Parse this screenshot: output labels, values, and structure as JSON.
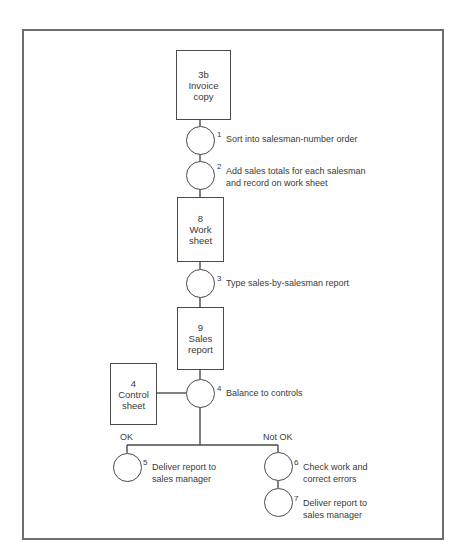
{
  "diagram": {
    "type": "flowchart",
    "documents": [
      {
        "id": "3b",
        "number": "3b",
        "line1": "Invoice",
        "line2": "copy"
      },
      {
        "id": "8",
        "number": "8",
        "line1": "Work",
        "line2": "sheet"
      },
      {
        "id": "9",
        "number": "9",
        "line1": "Sales",
        "line2": "report"
      },
      {
        "id": "4",
        "number": "4",
        "line1": "Control",
        "line2": "sheet"
      }
    ],
    "steps": [
      {
        "number": "1",
        "line1": "Sort into salesman-number order",
        "line2": ""
      },
      {
        "number": "2",
        "line1": "Add sales totals for  each salesman",
        "line2": "and record on work sheet"
      },
      {
        "number": "3",
        "line1": "Type sales-by-salesman report",
        "line2": ""
      },
      {
        "number": "4",
        "line1": "Balance to controls",
        "line2": ""
      },
      {
        "number": "5",
        "line1": "Deliver report to",
        "line2": "sales manager"
      },
      {
        "number": "6",
        "line1": "Check work and",
        "line2": "correct errors"
      },
      {
        "number": "7",
        "line1": "Deliver report to",
        "line2": "sales manager"
      }
    ],
    "branches": {
      "ok_label": "OK",
      "not_ok_label": "Not OK"
    },
    "colors": {
      "line": "#4a4a4a",
      "frame": "#6e6e6e",
      "text": "#3a3a3a",
      "background": "#ffffff"
    }
  }
}
